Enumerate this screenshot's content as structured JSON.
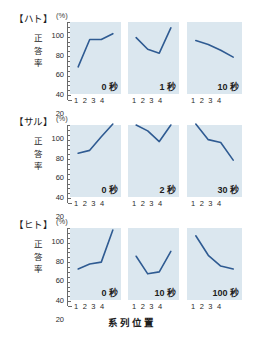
{
  "chart_data": {
    "type": "line",
    "title": "",
    "xlabel": "系列位置",
    "ylabel": "正答率",
    "unit_label": "(%)",
    "ylim": [
      20,
      100
    ],
    "yticks": [
      100,
      80,
      60,
      40,
      20
    ],
    "ytick_labels": [
      "100",
      "80",
      "60",
      "40",
      "20"
    ],
    "xticks": [
      1,
      2,
      3,
      4
    ],
    "xtick_labels": "1 2 3 4",
    "grid": false,
    "legend": "none",
    "panel_background": "#dbe7ef",
    "line_color": "#2f5b92",
    "rows": [
      {
        "species": "【ハト】",
        "panels": [
          {
            "caption": "0 秒",
            "x": [
              1,
              2,
              3,
              4
            ],
            "values": [
              54,
              82,
              82,
              88
            ]
          },
          {
            "caption": "1 秒",
            "x": [
              1,
              2,
              3,
              4
            ],
            "values": [
              84,
              72,
              68,
              94
            ]
          },
          {
            "caption": "10 秒",
            "x": [
              1,
              2,
              3,
              4
            ],
            "values": [
              81,
              77,
              71,
              64
            ]
          }
        ]
      },
      {
        "species": "【サル】",
        "panels": [
          {
            "caption": "0 秒",
            "x": [
              1,
              2,
              3,
              4
            ],
            "values": [
              71,
              74,
              88,
              101
            ]
          },
          {
            "caption": "2 秒",
            "x": [
              1,
              2,
              3,
              4
            ],
            "values": [
              100,
              94,
              83,
              100
            ]
          },
          {
            "caption": "30 秒",
            "x": [
              1,
              2,
              3,
              4
            ],
            "values": [
              101,
              85,
              82,
              64
            ]
          }
        ]
      },
      {
        "species": "【ヒト】",
        "panels": [
          {
            "caption": "0 秒",
            "x": [
              1,
              2,
              3,
              4
            ],
            "values": [
              58,
              63,
              65,
              98
            ]
          },
          {
            "caption": "10 秒",
            "x": [
              1,
              2,
              3,
              4
            ],
            "values": [
              71,
              53,
              55,
              76
            ]
          },
          {
            "caption": "100 秒",
            "x": [
              1,
              2,
              3,
              4
            ],
            "values": [
              92,
              72,
              61,
              58
            ]
          }
        ]
      }
    ]
  }
}
